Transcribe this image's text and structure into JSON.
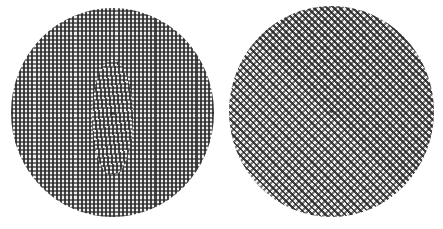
{
  "figure": {
    "panels": [
      {
        "id": "left",
        "shape": "circle",
        "pattern": "orthogonal-grid",
        "orientation_deg": 0,
        "distortion": "wavy center",
        "colors": {
          "dark": "#282828",
          "light": "#ffffff"
        }
      },
      {
        "id": "right",
        "shape": "circle",
        "pattern": "diagonal-grid",
        "orientation_deg": 45,
        "distortion": "center defect",
        "colors": {
          "dark": "#232323",
          "light": "#ffffff"
        }
      }
    ],
    "background": "#ffffff"
  }
}
